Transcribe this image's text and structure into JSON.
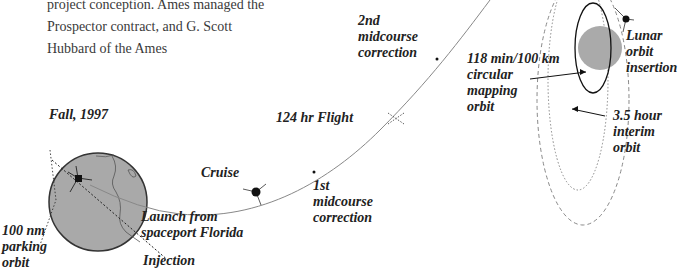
{
  "paragraph": {
    "lines": [
      "project conception. Ames managed the",
      "Prospector contract, and G. Scott",
      "Hubbard of the Ames"
    ]
  },
  "diagram": {
    "labels": {
      "fall": "Fall, 1997",
      "parking": [
        "100 nm",
        "parking",
        "orbit"
      ],
      "launch": [
        "Launch from",
        "spaceport Florida"
      ],
      "injection": "Injection",
      "cruise": "Cruise",
      "first_mcc": [
        "1st",
        "midcourse",
        "correction"
      ],
      "flight": "124 hr Flight",
      "second_mcc": [
        "2nd",
        "midcourse",
        "correction"
      ],
      "mapping": [
        "118 min/100 km",
        "circular",
        "mapping",
        "orbit"
      ],
      "loi": [
        "Lunar",
        "orbit",
        "insertion"
      ],
      "interim": [
        "3.5 hour",
        "interim",
        "orbit"
      ]
    },
    "colors": {
      "earth": "#a8a8a8",
      "moon": "#aaaaaa",
      "trajectory": "#888888",
      "text": "#222222"
    }
  }
}
